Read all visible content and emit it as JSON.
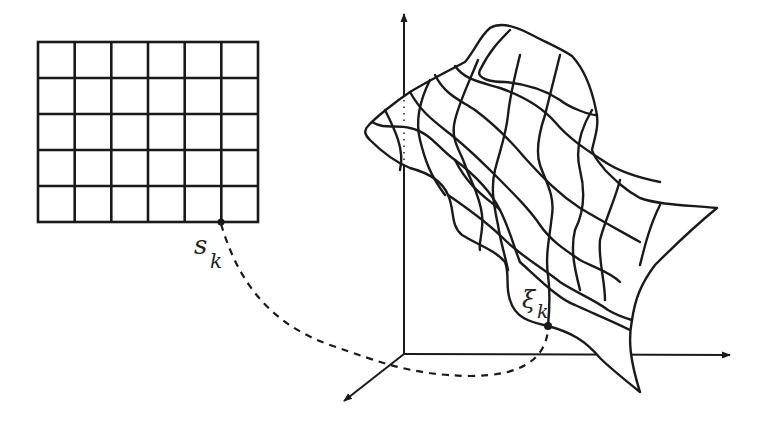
{
  "diagram": {
    "colors": {
      "stroke": "#1a1a1a",
      "background": "#ffffff"
    },
    "parameter_grid": {
      "columns": 6,
      "rows": 5,
      "x": 38,
      "y": 42,
      "width": 220,
      "height": 180
    },
    "labels": {
      "source_point_base": "s",
      "source_point_sub": "k",
      "image_point_base": "ξ",
      "image_point_sub": "k"
    },
    "axes": {
      "origin": [
        404,
        354
      ],
      "vertical_end": [
        404,
        12
      ],
      "horizontal_end": [
        732,
        355
      ],
      "depth_end": [
        342,
        403
      ]
    },
    "points": {
      "s_k": [
        221,
        222
      ],
      "xi_k": [
        548,
        326
      ]
    }
  }
}
